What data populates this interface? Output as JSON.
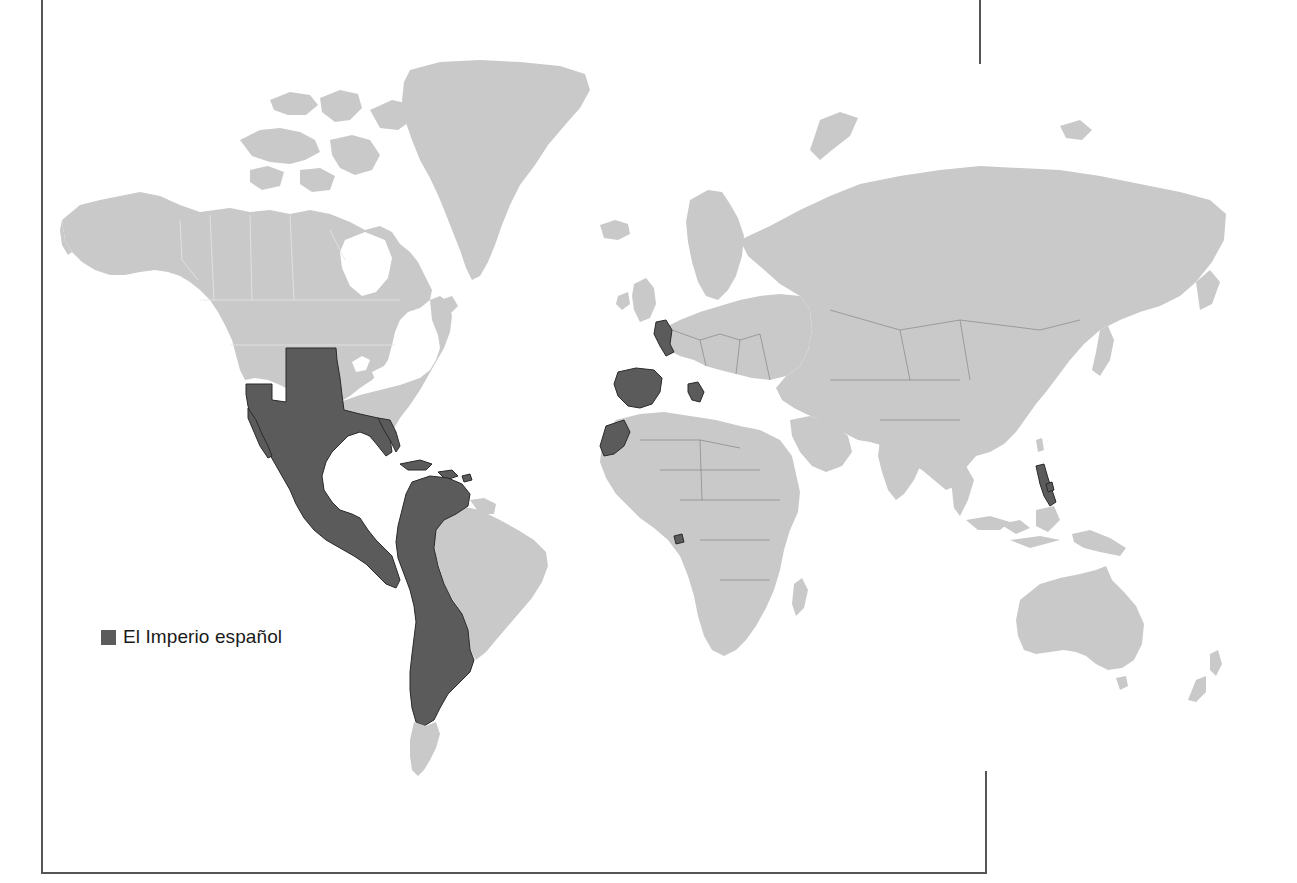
{
  "map": {
    "type": "world-map",
    "projection": "mercator",
    "style": "grayscale",
    "colors": {
      "background": "#ffffff",
      "land": "#c9c9c9",
      "highlight": "#5b5b5b",
      "frame": "#555555"
    },
    "legend": {
      "items": [
        {
          "label": "El Imperio español",
          "color": "#5b5b5b"
        }
      ]
    },
    "highlighted_regions": [
      "Southwestern North America (Mexico, western and central United States, Florida)",
      "Central America",
      "Caribbean islands",
      "Western South America (Venezuela, Colombia, Ecuador, Peru, Bolivia, Chile, Paraguay, Argentina, Uruguay)",
      "Spain",
      "Netherlands/Belgium",
      "Southern Italy",
      "Western Sahara / Northwest Africa",
      "Equatorial Guinea",
      "Philippines"
    ]
  }
}
